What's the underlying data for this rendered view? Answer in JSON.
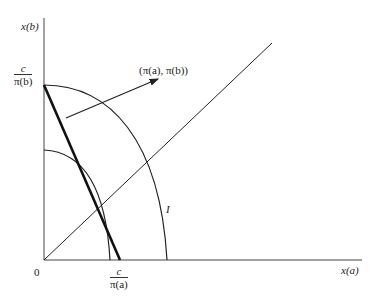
{
  "diagram": {
    "axes": {
      "y_label": "x(b)",
      "x_label": "x(a)",
      "origin_label": "0"
    },
    "intercepts": {
      "y_intercept": {
        "numerator": "c",
        "denominator": "π(b)"
      },
      "x_intercept": {
        "numerator": "c",
        "denominator": "π(a)"
      }
    },
    "annotations": {
      "price_vector": "(π(a), π(b))",
      "indifference_label": "I"
    },
    "elements": [
      "budget line (thick)",
      "outer indifference curve I",
      "inner curve",
      "45-degree ray from origin",
      "price vector arrow normal to budget line"
    ],
    "colors": {
      "stroke": "#222222",
      "background": "#ffffff"
    }
  }
}
